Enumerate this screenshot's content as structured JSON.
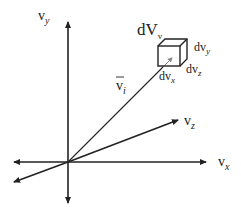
{
  "diagram": {
    "type": "3d-velocity-space",
    "axes": {
      "vy": {
        "main": "v",
        "sub": "y"
      },
      "vx": {
        "main": "v",
        "sub": "x"
      },
      "vz": {
        "main": "v",
        "sub": "z"
      }
    },
    "vector": {
      "main": "v",
      "sub": "i",
      "overline": true
    },
    "volume_element": {
      "main": "dV",
      "sub": "v"
    },
    "cube_edges": {
      "x": {
        "main": "dv",
        "sub": "x"
      },
      "y": {
        "main": "dv",
        "sub": "y"
      },
      "z": {
        "main": "dv",
        "sub": "z"
      }
    },
    "colors": {
      "line": "#222222",
      "vector_tip": "#888888",
      "background": "#ffffff"
    }
  }
}
